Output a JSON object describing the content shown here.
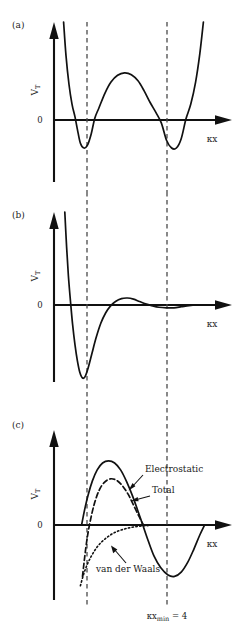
{
  "figure": {
    "background": "#ffffff",
    "ink": "#111111",
    "guide_color": "#4a4a4a"
  },
  "panels": [
    {
      "id": "a",
      "label": "(a)",
      "y_axis_label": "V_T",
      "y_axis_label_main": "V",
      "y_axis_label_sub": "T",
      "x_axis_label": "κx",
      "zero_label": "0"
    },
    {
      "id": "b",
      "label": "(b)",
      "y_axis_label": "V_T",
      "y_axis_label_main": "V",
      "y_axis_label_sub": "T",
      "x_axis_label": "κx",
      "zero_label": "0"
    },
    {
      "id": "c",
      "label": "(c)",
      "y_axis_label": "V_T",
      "y_axis_label_main": "V",
      "y_axis_label_sub": "T",
      "x_axis_label": "κx",
      "zero_label": "0",
      "curve_labels": [
        {
          "name": "electrostatic",
          "text": "Electrostatic",
          "style": "solid"
        },
        {
          "name": "total",
          "text": "Total",
          "style": "dashed"
        },
        {
          "name": "van-der-waals",
          "text": "van der Waals",
          "style": "dotted"
        }
      ],
      "footnote": {
        "main": "κx",
        "sub": "min",
        "tail": " = 4",
        "full": "κx_min = 4"
      }
    }
  ],
  "chart_data": [
    {
      "type": "line",
      "panel": "a",
      "title": "(a)",
      "xlabel": "κx",
      "ylabel": "V_T",
      "grid": false,
      "legend": "none",
      "description": "Symmetric double-well total interaction potential with two equal minima located at the two dashed guide lines and a positive barrier between them; steep repulsive walls at both ends.",
      "guides": [
        {
          "name": "left-guide",
          "x": 1.0
        },
        {
          "name": "right-guide",
          "x": 4.0
        }
      ],
      "xlim": [
        0,
        5.6
      ],
      "ylim": [
        -0.45,
        1.6
      ],
      "series": [
        {
          "name": "total-potential",
          "style": "solid",
          "points": [
            [
              0.32,
              1.6
            ],
            [
              0.4,
              1.05
            ],
            [
              0.5,
              0.58
            ],
            [
              0.6,
              0.26
            ],
            [
              0.7,
              0.05
            ],
            [
              0.78,
              -0.06
            ],
            [
              0.88,
              -0.15
            ],
            [
              1.0,
              -0.18
            ],
            [
              1.12,
              -0.16
            ],
            [
              1.24,
              -0.09
            ],
            [
              1.36,
              0.03
            ],
            [
              1.5,
              0.2
            ],
            [
              1.7,
              0.44
            ],
            [
              1.9,
              0.62
            ],
            [
              2.12,
              0.73
            ],
            [
              2.35,
              0.77
            ],
            [
              2.58,
              0.74
            ],
            [
              2.8,
              0.64
            ],
            [
              3.0,
              0.48
            ],
            [
              3.2,
              0.29
            ],
            [
              3.4,
              0.12
            ],
            [
              3.58,
              -0.02
            ],
            [
              3.75,
              -0.13
            ],
            [
              3.92,
              -0.18
            ],
            [
              4.08,
              -0.18
            ],
            [
              4.24,
              -0.12
            ],
            [
              4.4,
              0.02
            ],
            [
              4.56,
              0.26
            ],
            [
              4.72,
              0.62
            ],
            [
              4.86,
              1.08
            ],
            [
              4.98,
              1.6
            ]
          ]
        }
      ]
    },
    {
      "type": "line",
      "panel": "b",
      "title": "(b)",
      "xlabel": "κx",
      "ylabel": "V_T",
      "grid": false,
      "legend": "none",
      "description": "Damped oscillatory potential: a steep repulsive wall falls to a single deep primary minimum near the first dashed guide, followed by a small positive maximum and a very shallow secondary minimum near the second dashed guide, decaying to zero.",
      "guides": [
        {
          "name": "left-guide",
          "x": 1.0
        },
        {
          "name": "right-guide",
          "x": 4.0
        }
      ],
      "xlim": [
        0,
        5.6
      ],
      "ylim": [
        -1.35,
        1.6
      ],
      "series": [
        {
          "name": "total-potential",
          "style": "solid",
          "points": [
            [
              0.36,
              1.6
            ],
            [
              0.42,
              1.0
            ],
            [
              0.48,
              0.5
            ],
            [
              0.55,
              0.06
            ],
            [
              0.62,
              -0.34
            ],
            [
              0.7,
              -0.7
            ],
            [
              0.78,
              -0.98
            ],
            [
              0.86,
              -1.18
            ],
            [
              0.95,
              -1.28
            ],
            [
              1.04,
              -1.25
            ],
            [
              1.14,
              -1.1
            ],
            [
              1.26,
              -0.86
            ],
            [
              1.4,
              -0.58
            ],
            [
              1.56,
              -0.32
            ],
            [
              1.72,
              -0.14
            ],
            [
              1.88,
              -0.02
            ],
            [
              2.05,
              0.06
            ],
            [
              2.25,
              0.11
            ],
            [
              2.45,
              0.12
            ],
            [
              2.65,
              0.1
            ],
            [
              2.85,
              0.06
            ],
            [
              3.05,
              0.02
            ],
            [
              3.25,
              -0.01
            ],
            [
              3.5,
              -0.04
            ],
            [
              3.75,
              -0.05
            ],
            [
              4.0,
              -0.05
            ],
            [
              4.25,
              -0.03
            ],
            [
              4.5,
              -0.01
            ],
            [
              4.75,
              0.0
            ],
            [
              5.1,
              0.0
            ],
            [
              5.4,
              0.0
            ]
          ]
        }
      ]
    },
    {
      "type": "line",
      "panel": "c",
      "title": "(c)",
      "xlabel": "κx",
      "ylabel": "V_T",
      "grid": false,
      "legend": "inline-annotations",
      "description": "DLVO-style decomposition: a solid electrostatic repulsion curve with a positive maximum that decays and becomes negative into a secondary minimum at the second dashed guide; a dashed total curve with a lower barrier; a dotted van der Waals attraction rising from negative values toward zero.",
      "guides": [
        {
          "name": "left-guide",
          "x": 1.0
        },
        {
          "name": "right-guide",
          "x": 4.0
        }
      ],
      "annotation": "κx_min = 4",
      "xlim": [
        0,
        5.6
      ],
      "ylim": [
        -1.05,
        1.35
      ],
      "series": [
        {
          "name": "electrostatic",
          "style": "solid",
          "label": "Electrostatic",
          "points": [
            [
              0.92,
              0.0
            ],
            [
              1.02,
              0.22
            ],
            [
              1.14,
              0.44
            ],
            [
              1.28,
              0.64
            ],
            [
              1.44,
              0.8
            ],
            [
              1.62,
              0.9
            ],
            [
              1.82,
              0.93
            ],
            [
              2.02,
              0.9
            ],
            [
              2.22,
              0.8
            ],
            [
              2.42,
              0.63
            ],
            [
              2.62,
              0.42
            ],
            [
              2.8,
              0.2
            ],
            [
              2.96,
              0.0
            ],
            [
              3.14,
              -0.22
            ],
            [
              3.34,
              -0.44
            ],
            [
              3.56,
              -0.6
            ],
            [
              3.8,
              -0.7
            ],
            [
              4.02,
              -0.72
            ],
            [
              4.24,
              -0.66
            ],
            [
              4.46,
              -0.52
            ],
            [
              4.66,
              -0.34
            ],
            [
              4.86,
              -0.14
            ],
            [
              5.02,
              0.0
            ]
          ]
        },
        {
          "name": "total",
          "style": "dashed",
          "label": "Total",
          "points": [
            [
              0.95,
              -0.72
            ],
            [
              1.02,
              -0.46
            ],
            [
              1.1,
              -0.2
            ],
            [
              1.2,
              0.04
            ],
            [
              1.34,
              0.3
            ],
            [
              1.5,
              0.5
            ],
            [
              1.68,
              0.62
            ],
            [
              1.88,
              0.67
            ],
            [
              2.08,
              0.65
            ],
            [
              2.28,
              0.57
            ],
            [
              2.48,
              0.44
            ],
            [
              2.66,
              0.28
            ],
            [
              2.84,
              0.12
            ],
            [
              2.98,
              0.0
            ]
          ]
        },
        {
          "name": "van-der-waals",
          "style": "dotted",
          "label": "van der Waals",
          "points": [
            [
              0.88,
              -0.85
            ],
            [
              0.98,
              -0.7
            ],
            [
              1.1,
              -0.56
            ],
            [
              1.24,
              -0.44
            ],
            [
              1.4,
              -0.33
            ],
            [
              1.58,
              -0.24
            ],
            [
              1.78,
              -0.17
            ],
            [
              2.0,
              -0.11
            ],
            [
              2.24,
              -0.07
            ],
            [
              2.5,
              -0.04
            ],
            [
              2.78,
              -0.02
            ],
            [
              3.06,
              -0.01
            ],
            [
              3.3,
              0.0
            ]
          ]
        }
      ]
    }
  ]
}
